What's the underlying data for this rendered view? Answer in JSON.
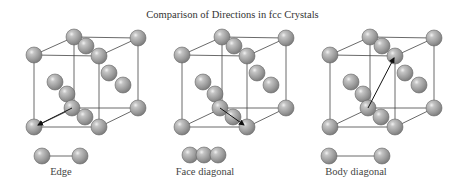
{
  "title": "Comparison of Directions in fcc Crystals",
  "colors": {
    "sphere_fill": "#9b9b9b",
    "sphere_stroke": "#555555",
    "edge": "#333333",
    "arrow": "#111111",
    "text": "#333333"
  },
  "panels": [
    {
      "id": "edge",
      "caption": "Edge",
      "offset_x": 0,
      "arrow": "edge",
      "row": "pair"
    },
    {
      "id": "face-diagonal",
      "caption": "Face diagonal",
      "offset_x": 148,
      "arrow": "face",
      "row": "triple"
    },
    {
      "id": "body-diagonal",
      "caption": "Body diagonal",
      "offset_x": 296,
      "arrow": "body",
      "row": "pair-long"
    }
  ]
}
